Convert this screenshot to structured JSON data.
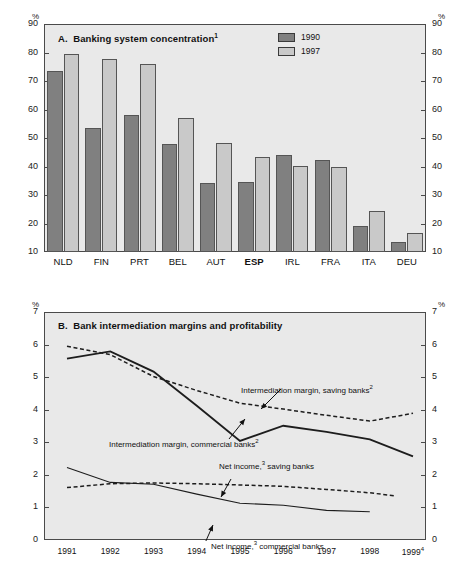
{
  "figure": {
    "axis_unit_label": "%"
  },
  "panelA": {
    "title_prefix": "A.",
    "title": "Banking system concentration",
    "title_footnote": "1",
    "legend": [
      {
        "label": "1990",
        "color": "#808080"
      },
      {
        "label": "1997",
        "color": "#c9c9c9"
      }
    ],
    "unit_left": "%",
    "unit_right": "%",
    "chart_data": {
      "type": "bar",
      "title": "A. Banking system concentration",
      "xlabel": "",
      "ylabel": "%",
      "ylim": [
        10,
        90
      ],
      "yticks": [
        10,
        20,
        30,
        40,
        50,
        60,
        70,
        80,
        90
      ],
      "grid": false,
      "legend_position": "top-right",
      "categories": [
        "NLD",
        "FIN",
        "PRT",
        "BEL",
        "AUT",
        "ESP",
        "IRL",
        "FRA",
        "ITA",
        "DEU"
      ],
      "highlighted_category": "ESP",
      "series": [
        {
          "name": "1990",
          "color": "#808080",
          "values": [
            73.5,
            53.5,
            58.0,
            48.0,
            34.3,
            34.7,
            44.0,
            42.2,
            19.0,
            13.5
          ]
        },
        {
          "name": "1997",
          "color": "#c9c9c9",
          "values": [
            79.5,
            77.8,
            76.0,
            57.0,
            48.2,
            43.3,
            40.3,
            40.0,
            24.3,
            16.5
          ]
        }
      ]
    }
  },
  "panelB": {
    "title_prefix": "B.",
    "title": "Bank intermediation margins and profitability",
    "unit_left": "%",
    "unit_right": "%",
    "annotations": [
      {
        "text": "Intermediation margin, saving banks",
        "footnote": "2"
      },
      {
        "text": "Intermediation margin, commercial banks",
        "footnote": "2"
      },
      {
        "text": "Net income,",
        "footnote": "3",
        "text2": " saving banks"
      },
      {
        "text": "Net income,",
        "footnote": "3",
        "text2": " commercial banks"
      }
    ],
    "chart_data": {
      "type": "line",
      "title": "B. Bank intermediation margins and profitability",
      "xlabel": "",
      "ylabel": "%",
      "ylim": [
        0,
        7
      ],
      "yticks": [
        0,
        1,
        2,
        3,
        4,
        5,
        6,
        7
      ],
      "grid": false,
      "legend_position": "inline-annotations",
      "x": [
        "1991",
        "1992",
        "1993",
        "1994",
        "1995",
        "1996",
        "1997",
        "1998",
        "1999"
      ],
      "x_last_footnote": "4",
      "series": [
        {
          "name": "Intermediation margin, saving banks",
          "style": "dashed",
          "values": [
            5.98,
            5.72,
            5.05,
            4.62,
            4.23,
            4.05,
            3.86,
            3.68,
            3.92
          ]
        },
        {
          "name": "Intermediation margin, commercial banks",
          "style": "solid",
          "values": [
            5.6,
            5.82,
            5.2,
            4.15,
            3.07,
            3.54,
            3.35,
            3.12,
            2.6
          ]
        },
        {
          "name": "Net income, saving banks",
          "style": "dashed",
          "values": [
            1.64,
            1.76,
            1.78,
            1.76,
            1.72,
            1.68,
            1.58,
            1.48,
            1.32
          ]
        },
        {
          "name": "Net income, commercial banks",
          "style": "solid",
          "values": [
            2.26,
            1.8,
            1.74,
            1.44,
            1.16,
            1.1,
            0.94,
            0.9,
            0.89
          ]
        }
      ],
      "series_truncated_note": {
        "Net income, saving banks": "ends at 1998.6",
        "Net income, commercial banks": "ends at 1998.0"
      }
    }
  }
}
